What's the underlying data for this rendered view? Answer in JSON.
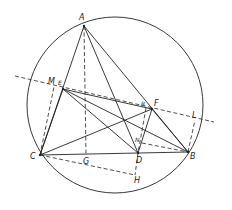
{
  "diagram": {
    "type": "geometry-construction",
    "colors": {
      "stroke": "#222222",
      "background": "#ffffff"
    },
    "circle": {
      "cx": 115,
      "cy": 105,
      "r": 88
    },
    "points": {
      "A": {
        "label": "A",
        "x": 84,
        "y": 26
      },
      "B": {
        "label": "B",
        "x": 188,
        "y": 152
      },
      "C": {
        "label": "C",
        "x": 40,
        "y": 155
      },
      "D": {
        "label": "D",
        "x": 138,
        "y": 153
      },
      "E": {
        "label": "E",
        "x": 63,
        "y": 89
      },
      "F": {
        "label": "F",
        "x": 152,
        "y": 109
      },
      "G": {
        "label": "G",
        "x": 86,
        "y": 154
      },
      "H": {
        "label": "H",
        "x": 135,
        "y": 175
      },
      "L": {
        "label": "L",
        "x": 195,
        "y": 120
      },
      "M": {
        "label": "M",
        "x": 54,
        "y": 87
      },
      "N": {
        "label": "N",
        "x": 142,
        "y": 143
      },
      "R": {
        "label": "R",
        "x": 146,
        "y": 108
      }
    },
    "solid_segments": [
      [
        "A",
        "C"
      ],
      [
        "A",
        "B"
      ],
      [
        "A",
        "D"
      ],
      [
        "C",
        "B"
      ],
      [
        "C",
        "E"
      ],
      [
        "E",
        "F"
      ],
      [
        "E",
        "B"
      ],
      [
        "E",
        "D"
      ],
      [
        "C",
        "F"
      ],
      [
        "F",
        "D"
      ],
      [
        "F",
        "B"
      ]
    ],
    "dashed_segments": [
      [
        "A",
        "G"
      ],
      [
        "C",
        "M"
      ],
      [
        "C",
        "H"
      ],
      [
        "D",
        "H"
      ],
      [
        "B",
        "L"
      ],
      [
        "N",
        "B"
      ],
      [
        "R",
        "D"
      ]
    ],
    "dashed_line": {
      "x1": 15,
      "y1": 76,
      "x2": 214,
      "y2": 122
    }
  }
}
